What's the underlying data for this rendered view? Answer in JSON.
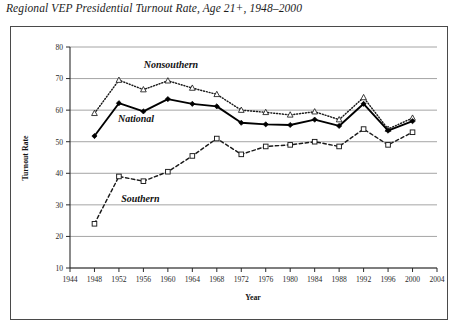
{
  "chart_data": {
    "type": "line",
    "title": "Regional VEP Presidential Turnout Rate, Age 21+, 1948–2000",
    "xlabel": "Year",
    "ylabel": "Turnout Rate",
    "x": [
      1948,
      1952,
      1956,
      1960,
      1964,
      1968,
      1972,
      1976,
      1980,
      1984,
      1988,
      1992,
      1996,
      2000
    ],
    "xlim": [
      1944,
      2004
    ],
    "ylim": [
      10,
      80
    ],
    "xticks": [
      1944,
      1948,
      1952,
      1956,
      1960,
      1964,
      1968,
      1972,
      1976,
      1980,
      1984,
      1988,
      1992,
      1996,
      2000,
      2004
    ],
    "yticks": [
      10,
      20,
      30,
      40,
      50,
      60,
      70,
      80
    ],
    "grid": true,
    "legend_position": "inline-annotations",
    "series": [
      {
        "name": "Nonsouthern",
        "marker": "open-triangle",
        "line_style": "dotted",
        "color": "#1a1a1a",
        "values": [
          59.0,
          69.5,
          66.5,
          69.3,
          67.0,
          65.0,
          60.0,
          59.3,
          58.5,
          59.5,
          57.0,
          64.0,
          54.0,
          57.5
        ]
      },
      {
        "name": "National",
        "marker": "filled-diamond",
        "line_style": "solid",
        "color": "#000000",
        "values": [
          51.8,
          62.2,
          59.6,
          63.5,
          62.0,
          61.2,
          56.0,
          55.5,
          55.3,
          57.0,
          55.0,
          62.0,
          53.5,
          56.5
        ]
      },
      {
        "name": "Southern",
        "marker": "open-square",
        "line_style": "dashed",
        "color": "#1a1a1a",
        "values": [
          24.0,
          39.0,
          37.5,
          40.5,
          45.5,
          51.0,
          46.0,
          48.5,
          49.0,
          50.0,
          48.5,
          54.0,
          49.0,
          53.0
        ]
      }
    ],
    "annotations": [
      {
        "text": "Nonsouthern",
        "x": 1960.5,
        "y": 73.2
      },
      {
        "text": "National",
        "x": 1954.8,
        "y": 56.2
      },
      {
        "text": "Southern",
        "x": 1955.5,
        "y": 31.0
      }
    ]
  },
  "axis": {
    "y_title": "Turnout Rate",
    "x_title": "Year"
  }
}
